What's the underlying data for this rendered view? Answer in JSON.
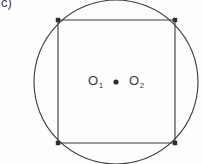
{
  "figure": {
    "panel_label": "c)",
    "background_color": "#fdfdfd",
    "stroke_color": "#3a3a3a",
    "stroke_width": 1.1,
    "width": 202,
    "height": 164
  },
  "chart_data": {
    "type": "diagram",
    "title": "c)",
    "xlabel": "",
    "ylabel": "",
    "shapes": [
      {
        "name": "circumscribed-circle",
        "kind": "circle",
        "cx": 116,
        "cy": 82,
        "r": 82,
        "stroke": "#3a3a3a",
        "fill": "none",
        "clipped": "top and bottom of the circle are cut off by the image border"
      },
      {
        "name": "inscribed-square",
        "kind": "square",
        "corners": [
          [
            58,
            20
          ],
          [
            175,
            20
          ],
          [
            175,
            143
          ],
          [
            58,
            143
          ]
        ],
        "side": 117,
        "stroke": "#3a3a3a",
        "fill": "none"
      },
      {
        "name": "centre-dot",
        "kind": "dot",
        "cx": 116,
        "cy": 82,
        "r": 2.6,
        "fill": "#2f2f2f"
      }
    ],
    "vertex_markers": [
      {
        "name": "corner-marker-top-left",
        "cx": 58,
        "cy": 20,
        "size": 4.4
      },
      {
        "name": "corner-marker-top-right",
        "cx": 175,
        "cy": 20,
        "size": 4.4
      },
      {
        "name": "corner-marker-bottom-right",
        "cx": 175,
        "cy": 143,
        "size": 4.4
      },
      {
        "name": "corner-marker-bottom-left",
        "cx": 58,
        "cy": 143,
        "size": 4.4
      }
    ],
    "annotations": [
      {
        "name": "point-label-o1",
        "base": "O",
        "subscript": "1",
        "x": 88,
        "y": 74
      },
      {
        "name": "point-label-o2",
        "base": "O",
        "subscript": "2",
        "x": 129,
        "y": 74
      }
    ]
  },
  "labels": {
    "o1": {
      "base": "O",
      "sub": "1"
    },
    "o2": {
      "base": "O",
      "sub": "2"
    }
  }
}
